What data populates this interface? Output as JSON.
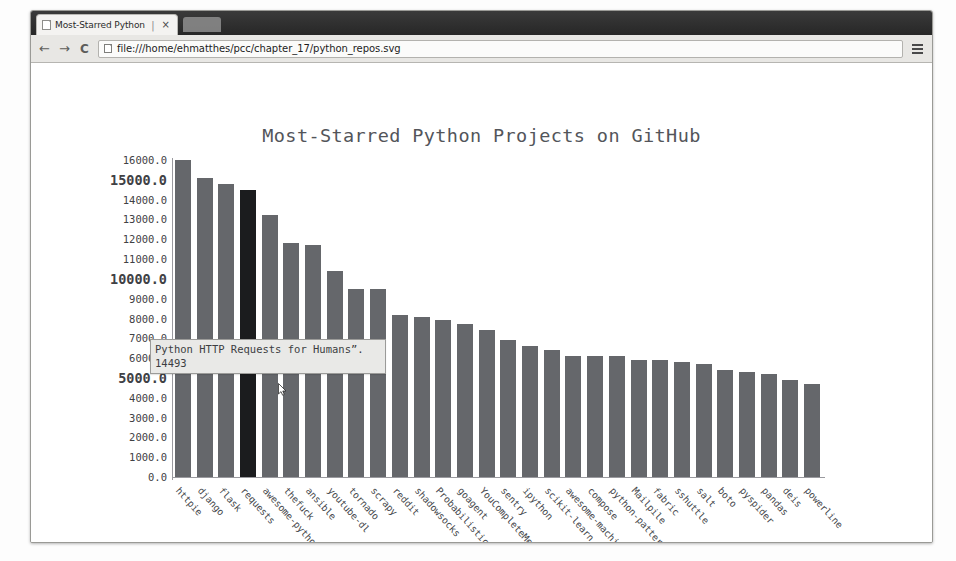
{
  "browser": {
    "tab": {
      "title": "Most-Starred Python",
      "separator": "|",
      "close_label": "×",
      "favicon_name": "page-icon"
    },
    "toolbar": {
      "back_label": "←",
      "forward_label": "→",
      "reload_label": "C",
      "url": "file:///home/ehmatthes/pcc/chapter_17/python_repos.svg",
      "url_placeholder": "Search Google or type URL",
      "menu_label": "menu"
    }
  },
  "chart_data": {
    "type": "bar",
    "title": "Most-Starred Python Projects on GitHub",
    "xlabel": "",
    "ylabel": "",
    "ylim": [
      0,
      16000
    ],
    "grid": false,
    "legend": "none",
    "bar_color": "#65676b",
    "highlight_color": "#1b1c1e",
    "highlight_index": 3,
    "ytick_labels": [
      "16000.0",
      "15000.0",
      "14000.0",
      "13000.0",
      "12000.0",
      "11000.0",
      "10000.0",
      "9000.0",
      "8000.0",
      "7000.0",
      "6000.0",
      "5000.0",
      "4000.0",
      "3000.0",
      "2000.0",
      "1000.0",
      "0.0"
    ],
    "ytick_values": [
      16000,
      15000,
      14000,
      13000,
      12000,
      11000,
      10000,
      9000,
      8000,
      7000,
      6000,
      5000,
      4000,
      3000,
      2000,
      1000,
      0
    ],
    "ytick_major": [
      15000,
      10000,
      5000
    ],
    "categories": [
      "httpie",
      "django",
      "flask",
      "requests",
      "awesome-python",
      "thefuck",
      "ansible",
      "youtube-dl",
      "tornado",
      "scrapy",
      "reddit",
      "shadowsocks",
      "Probabilistic-",
      "goagent",
      "YouCompleteMe",
      "sentry",
      "ipython",
      "scikit-learn",
      "awesome-machin_",
      "compose",
      "python-patterns",
      "Mailpile",
      "fabric",
      "sshuttle",
      "salt",
      "boto",
      "pyspider",
      "pandas",
      "deis",
      "powerline"
    ],
    "values": [
      16000,
      15100,
      14800,
      14493,
      13200,
      11800,
      11700,
      10400,
      9500,
      9500,
      8200,
      8100,
      7900,
      7700,
      7400,
      6900,
      6600,
      6400,
      6100,
      6100,
      6100,
      5900,
      5900,
      5800,
      5700,
      5400,
      5300,
      5200,
      4900,
      4700
    ]
  },
  "tooltip": {
    "label": "Python HTTP Requests for Humans”.",
    "value": "14493"
  }
}
